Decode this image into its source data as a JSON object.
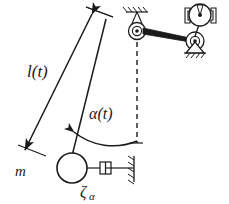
{
  "figure": {
    "type": "mechanical-schematic",
    "background_color": "#ffffff",
    "stroke_color": "#1a1a1a"
  },
  "labels": {
    "length": "l(t)",
    "angle": "α(t)",
    "mass": "m",
    "damping": "ζ",
    "damping_subscript": "α"
  },
  "components": {
    "pivot": {
      "name": "main-pivot",
      "cx": 137,
      "cy": 31,
      "r_outer": 8,
      "r_inner": 4.5,
      "r_dot": 1.7
    },
    "ground_pivot": {
      "name": "pivot-ground-hatch",
      "x": 126,
      "y": 12,
      "width": 22
    },
    "mass": {
      "name": "pendulum-mass",
      "cx": 72,
      "cy": 168,
      "r": 15
    },
    "damper": {
      "name": "rotational-damper",
      "x": 92,
      "y": 168,
      "wall_x": 134
    },
    "damper_wall": {
      "name": "damper-ground-wall",
      "x": 134,
      "y_top": 156,
      "y_bottom": 182
    },
    "vertical_reference": {
      "name": "vertical-dashed-reference",
      "x": 137,
      "y_top": 42,
      "y_bottom": 142
    },
    "angle_arc": {
      "name": "angle-arc",
      "radius": 74
    },
    "link": {
      "name": "connecting-link",
      "from": "main-pivot",
      "to": "crank-bearing"
    },
    "crank_bearing": {
      "name": "crank-bearing",
      "cx": 195,
      "cy": 41,
      "r_outer": 9,
      "r_inner": 4.5
    },
    "bearing_support": {
      "name": "bearing-ground-support",
      "x": 195,
      "y": 50
    },
    "motor": {
      "name": "motor-drive",
      "cx": 200,
      "cy": 15,
      "r": 11
    }
  },
  "geometry": {
    "rod_top_x": 106,
    "rod_top_y": 20,
    "rod_bottom_x": 72,
    "rod_bottom_y": 168,
    "dim_top_x": 92,
    "dim_top_y": 14,
    "dim_bottom_x": 25,
    "dim_bottom_y": 150
  }
}
